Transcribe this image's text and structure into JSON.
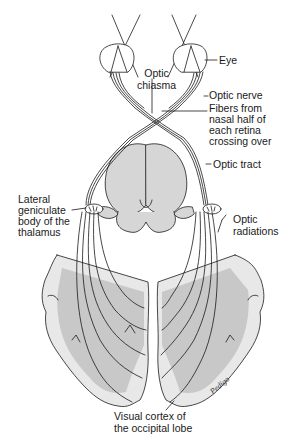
{
  "diagram": {
    "type": "anatomical-illustration",
    "colors": {
      "line": "#1a1a1a",
      "fill_gray": "#c8c8c8",
      "fill_light": "#e6e6e6",
      "background": "#ffffff"
    },
    "labels": {
      "eye": "Eye",
      "optic_chiasma": "Optic\nchiasma",
      "optic_nerve": "Optic nerve",
      "nasal_fibers": "Fibers from\nnasal half of\neach retina\ncrossing over",
      "optic_tract": "Optic tract",
      "lateral_geniculate": "Lateral\ngeniculate\nbody of the\nthalamus",
      "optic_radiations": "Optic\nradiations",
      "visual_cortex": "Visual cortex of\nthe occipital lobe",
      "signature": "Pedigo"
    }
  }
}
